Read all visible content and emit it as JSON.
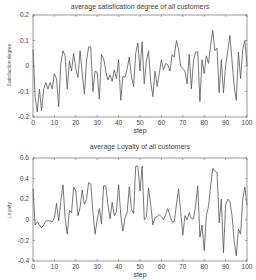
{
  "chart_data": [
    {
      "type": "line",
      "title": "average satisfication degree of all customers",
      "xlabel": "step",
      "ylabel": "Satisfaction degree",
      "xlim": [
        0,
        100
      ],
      "ylim": [
        -0.2,
        0.2
      ],
      "xticks": [
        0,
        10,
        20,
        30,
        40,
        50,
        60,
        70,
        80,
        90,
        100
      ],
      "yticks": [
        -0.2,
        -0.1,
        0,
        0.1,
        0.2
      ],
      "ytick_labels": [
        "-0.2",
        "-0.1",
        "0",
        "0.1",
        "0.2"
      ],
      "grid": false,
      "line_color": "#555555",
      "x": [
        0,
        1,
        2,
        3,
        4,
        5,
        6,
        7,
        8,
        9,
        10,
        11,
        12,
        13,
        14,
        15,
        16,
        17,
        18,
        19,
        20,
        21,
        22,
        23,
        24,
        25,
        26,
        27,
        28,
        29,
        30,
        31,
        32,
        33,
        34,
        35,
        36,
        37,
        38,
        39,
        40,
        41,
        42,
        43,
        44,
        45,
        46,
        47,
        48,
        49,
        50,
        51,
        52,
        53,
        54,
        55,
        56,
        57,
        58,
        59,
        60,
        61,
        62,
        63,
        64,
        65,
        66,
        67,
        68,
        69,
        70,
        71,
        72,
        73,
        74,
        75,
        76,
        77,
        78,
        79,
        80,
        81,
        82,
        83,
        84,
        85,
        86,
        87,
        88,
        89,
        90,
        91,
        92,
        93,
        94,
        95,
        96,
        97,
        98,
        99,
        100
      ],
      "values": [
        0.065,
        -0.12,
        -0.18,
        -0.09,
        -0.175,
        -0.09,
        -0.065,
        -0.09,
        -0.065,
        -0.09,
        -0.03,
        -0.05,
        -0.16,
        0.01,
        0.06,
        0.04,
        -0.09,
        0.02,
        -0.02,
        0.05,
        -0.01,
        -0.045,
        0.06,
        -0.03,
        -0.11,
        0.02,
        0.075,
        0.075,
        -0.1,
        -0.02,
        -0.025,
        -0.13,
        0.045,
        0.03,
        -0.02,
        -0.055,
        -0.035,
        -0.06,
        -0.015,
        -0.05,
        0.025,
        -0.135,
        -0.04,
        -0.045,
        -0.01,
        0.035,
        -0.04,
        -0.08,
        0.05,
        0.09,
        -0.02,
        0.095,
        -0.07,
        0.02,
        0.06,
        -0.06,
        -0.12,
        -0.02,
        -0.08,
        -0.03,
        0.025,
        -0.015,
        0.01,
        0.005,
        -0.02,
        0.045,
        0.035,
        0.1,
        0.065,
        0.0,
        -0.01,
        -0.02,
        -0.07,
        0.045,
        -0.09,
        0.02,
        0.055,
        0.055,
        -0.14,
        0.025,
        -0.03,
        0.04,
        0.01,
        0.08,
        0.14,
        0.06,
        0.07,
        -0.105,
        0.025,
        -0.105,
        0.0,
        0.06,
        0.12,
        0.02,
        -0.08,
        -0.135,
        0.055,
        -0.05,
        0.065,
        0.1,
        0.0
      ]
    },
    {
      "type": "line",
      "title": "average Loyalty of all customers",
      "xlabel": "step",
      "ylabel": "Loyalty",
      "xlim": [
        0,
        100
      ],
      "ylim": [
        -0.4,
        0.6
      ],
      "xticks": [
        0,
        10,
        20,
        30,
        40,
        50,
        60,
        70,
        80,
        90,
        100
      ],
      "yticks": [
        -0.4,
        -0.2,
        0,
        0.2,
        0.4,
        0.6
      ],
      "ytick_labels": [
        "-0.4",
        "-0.2",
        "0",
        "0.2",
        "0.4",
        "0.6"
      ],
      "grid": false,
      "line_color": "#555555",
      "x": [
        0,
        1,
        2,
        3,
        4,
        5,
        6,
        7,
        8,
        9,
        10,
        11,
        12,
        13,
        14,
        15,
        16,
        17,
        18,
        19,
        20,
        21,
        22,
        23,
        24,
        25,
        26,
        27,
        28,
        29,
        30,
        31,
        32,
        33,
        34,
        35,
        36,
        37,
        38,
        39,
        40,
        41,
        42,
        43,
        44,
        45,
        46,
        47,
        48,
        49,
        50,
        51,
        52,
        53,
        54,
        55,
        56,
        57,
        58,
        59,
        60,
        61,
        62,
        63,
        64,
        65,
        66,
        67,
        68,
        69,
        70,
        71,
        72,
        73,
        74,
        75,
        76,
        77,
        78,
        79,
        80,
        81,
        82,
        83,
        84,
        85,
        86,
        87,
        88,
        89,
        90,
        91,
        92,
        93,
        94,
        95,
        96,
        97,
        98,
        99,
        100
      ],
      "values": [
        0.3,
        -0.05,
        -0.02,
        -0.05,
        -0.08,
        -0.05,
        -0.01,
        -0.01,
        -0.01,
        -0.02,
        0.02,
        0.16,
        -0.01,
        0.18,
        0.34,
        0.02,
        -0.14,
        0.09,
        0.07,
        0.32,
        0.28,
        0.04,
        0.12,
        0.29,
        0.15,
        0.2,
        0.36,
        0.35,
        0.08,
        -0.14,
        0.0,
        0.11,
        -0.04,
        0.33,
        0.33,
        0.15,
        0.01,
        0.17,
        0.04,
        0.08,
        0.34,
        0.05,
        -0.11,
        0.02,
        0.07,
        0.32,
        0.1,
        0.06,
        0.52,
        0.52,
        0.28,
        0.52,
        0.0,
        0.03,
        0.31,
        0.15,
        -0.05,
        0.02,
        0.03,
        0.05,
        0.03,
        0.0,
        0.05,
        0.11,
        0.04,
        -0.02,
        -0.02,
        0.14,
        0.3,
        0.08,
        -0.15,
        0.04,
        0.0,
        0.07,
        0.01,
        0.01,
        0.14,
        0.33,
        -0.17,
        -0.05,
        -0.3,
        0.04,
        0.13,
        0.33,
        0.5,
        0.47,
        0.46,
        -0.03,
        0.2,
        -0.32,
        0.14,
        0.2,
        0.18,
        0.04,
        -0.2,
        -0.35,
        -0.09,
        -0.14,
        0.2,
        0.32,
        0.14
      ]
    }
  ]
}
